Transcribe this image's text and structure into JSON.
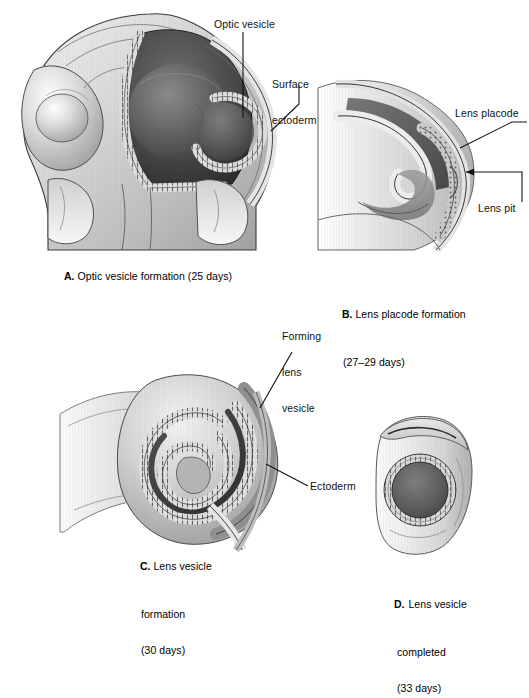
{
  "figure": {
    "title_implicit": "Development of the lens and optic vesicle",
    "background_color": "#ffffff",
    "ink_color": "#111111"
  },
  "panels": [
    {
      "id": "A",
      "letter": "A.",
      "caption_lines": [
        "Optic vesicle formation (25 days)"
      ],
      "caption_full": "A. Optic vesicle formation (25 days)",
      "day_range": "25 days",
      "labels": [
        {
          "name": "optic-vesicle",
          "lines": [
            "Optic vesicle"
          ],
          "text": "Optic vesicle"
        },
        {
          "name": "surface-ectoderm",
          "lines": [
            "Surface",
            "ectoderm"
          ],
          "text": "Surface ectoderm"
        }
      ]
    },
    {
      "id": "B",
      "letter": "B.",
      "caption_lines": [
        "Lens placode formation",
        "(27–29 days)"
      ],
      "caption_full": "B. Lens placode formation (27–29 days)",
      "day_range": "27–29 days",
      "labels": [
        {
          "name": "lens-placode",
          "lines": [
            "Lens placode"
          ],
          "text": "Lens placode"
        },
        {
          "name": "lens-pit",
          "lines": [
            "Lens pit"
          ],
          "text": "Lens pit"
        }
      ]
    },
    {
      "id": "C",
      "letter": "C.",
      "caption_lines": [
        "Lens vesicle",
        "formation",
        "(30 days)"
      ],
      "caption_full": "C. Lens vesicle formation (30 days)",
      "day_range": "30 days",
      "labels": [
        {
          "name": "forming-lens-vesicle",
          "lines": [
            "Forming",
            "lens",
            "vesicle"
          ],
          "text": "Forming lens vesicle"
        },
        {
          "name": "ectoderm",
          "lines": [
            "Ectoderm"
          ],
          "text": "Ectoderm"
        }
      ]
    },
    {
      "id": "D",
      "letter": "D.",
      "caption_lines": [
        "Lens vesicle",
        "completed",
        "(33 days)"
      ],
      "caption_full": "D. Lens vesicle completed (33 days)",
      "day_range": "33 days",
      "labels": []
    }
  ],
  "palette": {
    "paper": "#ffffff",
    "outline": "#1a1a1a",
    "tissue_light": "#e9e9e9",
    "tissue_mid": "#c2c2c2",
    "tissue_dark": "#8e8e8e",
    "cavity_dark": "#4a4a4a",
    "cavity_darkest": "#2f2f2f",
    "epithelium": "#d8d8d8"
  }
}
